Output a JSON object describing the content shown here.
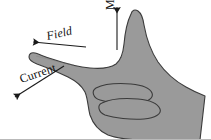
{
  "figure": {
    "name": "right-hand-rule-diagram",
    "background_color": "#ffffff",
    "hand": {
      "fill_color": "#9a9a9a",
      "outline_color": "#3b3b3b",
      "description": "right hand silhouette"
    },
    "labels": {
      "field": "Field",
      "current": "Current",
      "motion": "Motion"
    },
    "arrows": {
      "color": "#1a1a1a",
      "field_direction": "left-up",
      "current_direction": "left-down",
      "motion_direction": "up"
    }
  }
}
